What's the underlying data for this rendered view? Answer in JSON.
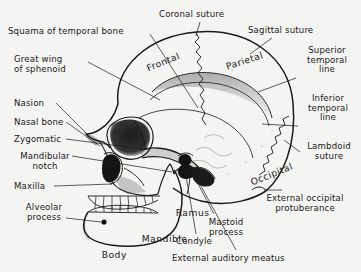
{
  "figure": {
    "type": "anatomical-illustration",
    "background_color": "#f4f4f2",
    "ink_color": "#1b1b1b"
  },
  "bone_labels": [
    {
      "id": "frontal",
      "text": "Frontal",
      "rotation_deg": -22,
      "x": 128,
      "y": 58
    },
    {
      "id": "parietal",
      "text": "Parietal",
      "rotation_deg": -18,
      "x": 208,
      "y": 55
    },
    {
      "id": "occipital",
      "text": "Occipital",
      "rotation_deg": -22,
      "x": 232,
      "y": 172
    },
    {
      "id": "ramus",
      "text": "Ramus",
      "rotation_deg": 0,
      "x": 162,
      "y": 196
    },
    {
      "id": "mandible",
      "text": "Mandible",
      "rotation_deg": 0,
      "x": 128,
      "y": 222
    },
    {
      "id": "body",
      "text": "Body",
      "rotation_deg": 0,
      "x": 88,
      "y": 238
    }
  ],
  "callouts": [
    {
      "id": "squama-temporal-bone",
      "text": "Squama of temporal bone",
      "align": "left",
      "x": 8,
      "y": 27
    },
    {
      "id": "great-wing-sphenoid",
      "text": "Great wing\nof sphenoid",
      "align": "left",
      "x": 14,
      "y": 55
    },
    {
      "id": "nasion",
      "text": "Nasion",
      "align": "left",
      "x": 14,
      "y": 99
    },
    {
      "id": "nasal-bone",
      "text": "Nasal bone",
      "align": "left",
      "x": 14,
      "y": 118
    },
    {
      "id": "zygomatic",
      "text": "Zygomatic",
      "align": "left",
      "x": 14,
      "y": 135
    },
    {
      "id": "mandibular-notch",
      "text": "Mandibular\nnotch",
      "align": "center",
      "x": 14,
      "y": 152
    },
    {
      "id": "maxilla",
      "text": "Maxilla",
      "align": "left",
      "x": 14,
      "y": 182
    },
    {
      "id": "alveolar-process",
      "text": "Alveolar\nprocess",
      "align": "center",
      "x": 14,
      "y": 203
    },
    {
      "id": "coronal-suture",
      "text": "Coronal suture",
      "align": "left",
      "x": 159,
      "y": 10
    },
    {
      "id": "sagittal-suture",
      "text": "Sagittal suture",
      "align": "left",
      "x": 248,
      "y": 26
    },
    {
      "id": "superior-temporal-line",
      "text": "Superior\ntemporal\nline",
      "align": "center",
      "x": 300,
      "y": 46
    },
    {
      "id": "inferior-temporal-line",
      "text": "Inferior\ntemporal\nline",
      "align": "center",
      "x": 303,
      "y": 94
    },
    {
      "id": "lambdoid-suture",
      "text": "Lambdoid\nsuture",
      "align": "center",
      "x": 303,
      "y": 142
    },
    {
      "id": "external-occipital-protuberance",
      "text": "External occipital\nprotuberance",
      "align": "center",
      "x": 254,
      "y": 194
    },
    {
      "id": "mastoid-process",
      "text": "Mastoid\nprocess",
      "align": "center",
      "x": 203,
      "y": 218
    },
    {
      "id": "condyle",
      "text": "Condyle",
      "align": "left",
      "x": 176,
      "y": 237
    },
    {
      "id": "external-auditory-meatus",
      "text": "External auditory meatus",
      "align": "left",
      "x": 172,
      "y": 254
    }
  ]
}
